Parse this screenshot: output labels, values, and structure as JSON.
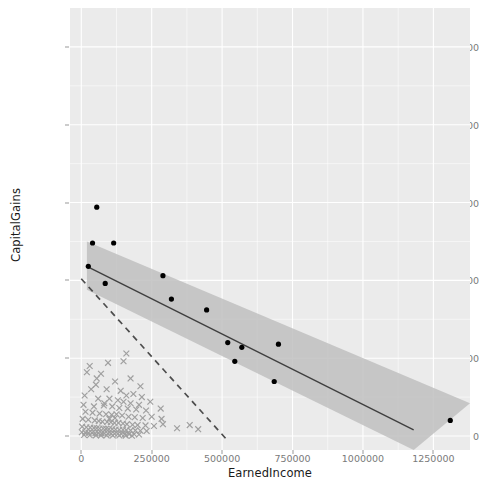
{
  "chart_data": {
    "type": "scatter",
    "title": "",
    "xlabel": "EarnedIncome",
    "ylabel": "CapitalGains",
    "xlim": [
      -40000,
      1380000
    ],
    "ylim": [
      -45000,
      1375000
    ],
    "xticks": [
      0,
      250000,
      500000,
      750000,
      1000000,
      1250000
    ],
    "xticklabels": [
      "0",
      "250000",
      "500000",
      "750000",
      "1000000",
      "1250000"
    ],
    "yticks": [
      0,
      250000,
      500000,
      750000,
      1000000,
      1250000
    ],
    "yticklabels": [
      "0",
      "250000",
      "500000",
      "750000",
      "1000000",
      "1250000"
    ],
    "grid": true,
    "grid_color": "#ffffff",
    "panel_background": "#ebebeb",
    "legend": "none",
    "series": [
      {
        "name": "highlighted-points",
        "marker": "filled-circle",
        "color": "#000000",
        "points": [
          [
            55000,
            735000
          ],
          [
            40000,
            620000
          ],
          [
            115000,
            620000
          ],
          [
            25000,
            545000
          ],
          [
            85000,
            490000
          ],
          [
            290000,
            515000
          ],
          [
            320000,
            440000
          ],
          [
            445000,
            405000
          ],
          [
            520000,
            300000
          ],
          [
            570000,
            285000
          ],
          [
            545000,
            240000
          ],
          [
            700000,
            295000
          ],
          [
            685000,
            175000
          ],
          [
            1310000,
            50000
          ]
        ]
      },
      {
        "name": "background-points",
        "marker": "cross",
        "color": "#8c8c8c",
        "points": [
          [
            30000,
            225000
          ],
          [
            95000,
            235000
          ],
          [
            150000,
            240000
          ],
          [
            160000,
            265000
          ],
          [
            20000,
            205000
          ],
          [
            55000,
            185000
          ],
          [
            70000,
            200000
          ],
          [
            120000,
            175000
          ],
          [
            175000,
            185000
          ],
          [
            210000,
            160000
          ],
          [
            35000,
            150000
          ],
          [
            90000,
            150000
          ],
          [
            140000,
            145000
          ],
          [
            160000,
            130000
          ],
          [
            185000,
            135000
          ],
          [
            215000,
            125000
          ],
          [
            12000,
            130000
          ],
          [
            60000,
            120000
          ],
          [
            100000,
            120000
          ],
          [
            130000,
            115000
          ],
          [
            150000,
            110000
          ],
          [
            175000,
            105000
          ],
          [
            205000,
            100000
          ],
          [
            245000,
            110000
          ],
          [
            8000,
            100000
          ],
          [
            45000,
            95000
          ],
          [
            80000,
            98000
          ],
          [
            110000,
            95000
          ],
          [
            135000,
            90000
          ],
          [
            165000,
            88000
          ],
          [
            195000,
            85000
          ],
          [
            230000,
            82000
          ],
          [
            15000,
            78000
          ],
          [
            40000,
            75000
          ],
          [
            65000,
            72000
          ],
          [
            88000,
            70000
          ],
          [
            108000,
            68000
          ],
          [
            125000,
            70000
          ],
          [
            145000,
            66000
          ],
          [
            168000,
            62000
          ],
          [
            190000,
            60000
          ],
          [
            218000,
            58000
          ],
          [
            250000,
            62000
          ],
          [
            282000,
            88000
          ],
          [
            285000,
            55000
          ],
          [
            290000,
            38000
          ],
          [
            5000,
            55000
          ],
          [
            25000,
            52000
          ],
          [
            48000,
            50000
          ],
          [
            62000,
            48000
          ],
          [
            75000,
            46000
          ],
          [
            92000,
            45000
          ],
          [
            105000,
            44000
          ],
          [
            118000,
            42000
          ],
          [
            132000,
            42000
          ],
          [
            148000,
            40000
          ],
          [
            162000,
            38000
          ],
          [
            182000,
            36000
          ],
          [
            200000,
            35000
          ],
          [
            228000,
            34000
          ],
          [
            258000,
            32000
          ],
          [
            3000,
            30000
          ],
          [
            18000,
            28000
          ],
          [
            32000,
            27000
          ],
          [
            45000,
            26000
          ],
          [
            55000,
            25000
          ],
          [
            65000,
            24000
          ],
          [
            78000,
            24000
          ],
          [
            88000,
            23000
          ],
          [
            98000,
            22000
          ],
          [
            110000,
            22000
          ],
          [
            122000,
            21000
          ],
          [
            135000,
            20000
          ],
          [
            148000,
            20000
          ],
          [
            160000,
            19000
          ],
          [
            175000,
            18000
          ],
          [
            192000,
            18000
          ],
          [
            210000,
            17000
          ],
          [
            232000,
            16000
          ],
          [
            340000,
            25000
          ],
          [
            385000,
            35000
          ],
          [
            415000,
            22000
          ],
          [
            2000,
            12000
          ],
          [
            14000,
            11000
          ],
          [
            26000,
            10000
          ],
          [
            38000,
            10000
          ],
          [
            50000,
            9000
          ],
          [
            60000,
            9000
          ],
          [
            72000,
            8500
          ],
          [
            82000,
            8000
          ],
          [
            94000,
            8000
          ],
          [
            106000,
            7500
          ],
          [
            118000,
            7000
          ],
          [
            130000,
            7000
          ],
          [
            142000,
            6500
          ],
          [
            155000,
            6000
          ],
          [
            170000,
            6000
          ],
          [
            188000,
            5500
          ],
          [
            205000,
            5000
          ],
          [
            10000,
            3000
          ],
          [
            30000,
            2500
          ],
          [
            52000,
            2000
          ],
          [
            70000,
            2000
          ],
          [
            90000,
            1800
          ],
          [
            112000,
            1500
          ],
          [
            135000,
            1500
          ],
          [
            158000,
            1200
          ],
          [
            180000,
            1000
          ],
          [
            100000,
            55000
          ],
          [
            120000,
            58000
          ],
          [
            82000,
            105000
          ],
          [
            52000,
            165000
          ]
        ]
      }
    ],
    "fit_line": {
      "name": "regression-line",
      "style": "solid",
      "color": "#3f3f3f",
      "x_start": 20000,
      "y_start": 545000,
      "x_end": 1180000,
      "y_end": 20000,
      "confidence_band": {
        "color": "#bfbfbf",
        "upper": [
          [
            20000,
            625000
          ],
          [
            1380000,
            105000
          ]
        ],
        "lower": [
          [
            20000,
            470000
          ],
          [
            1180000,
            -45000
          ]
        ]
      }
    },
    "reference_line": {
      "name": "dashed-reference-line",
      "style": "dashed",
      "color": "#4d4d4d",
      "x_start": 0,
      "y_start": 505000,
      "x_end": 515000,
      "y_end": -10000
    }
  }
}
